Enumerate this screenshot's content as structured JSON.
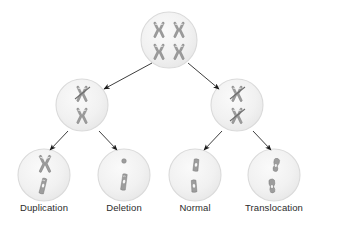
{
  "diagram": {
    "type": "flow-tree",
    "colors": {
      "background": "#ffffff",
      "cell_fill": "#f2f2f2",
      "cell_stroke": "#d8d8d8",
      "chromosome_fill": "#9a9a9a",
      "chromosome_stroke": "#6f6f6f",
      "chromosome_band": "#ffffff",
      "arrow": "#1b1b1b",
      "label_text": "#2b2b2b"
    },
    "levels": [
      {
        "name": "parent",
        "cells": [
          {
            "id": "parent-cell",
            "cx": 169,
            "cy": 40,
            "r": 28,
            "label": "",
            "chromosome_count": 4,
            "chromosome_kind": "metacentric-x",
            "description": "Normal cell with two pairs of X-shaped chromosomes"
          }
        ]
      },
      {
        "name": "intermediate",
        "cells": [
          {
            "id": "left-intermediate-cell",
            "cx": 82,
            "cy": 105,
            "r": 26,
            "label": "",
            "chromosome_count": 2,
            "chromosome_kind": "metacentric-x-with-break",
            "description": "Two chromosomes, upper one showing a diagonal break"
          },
          {
            "id": "right-intermediate-cell",
            "cx": 237,
            "cy": 105,
            "r": 26,
            "label": "",
            "chromosome_count": 2,
            "chromosome_kind": "metacentric-x-with-break",
            "description": "Two chromosomes, both showing diagonal breaks"
          }
        ]
      },
      {
        "name": "outcomes",
        "cells": [
          {
            "id": "duplication-cell",
            "cx": 44,
            "cy": 175,
            "r": 26,
            "label": "Duplication",
            "chromosome_count": 2,
            "chromosome_kind": "duplicated-and-normal",
            "description": "Enlarged duplicated chromosome above a shorter chromatid"
          },
          {
            "id": "deletion-cell",
            "cx": 124,
            "cy": 175,
            "r": 26,
            "label": "Deletion",
            "chromosome_count": 2,
            "chromosome_kind": "fragment-and-shortened",
            "description": "Tiny detached fragment above a shortened chromatid"
          },
          {
            "id": "normal-cell",
            "cx": 195,
            "cy": 175,
            "r": 26,
            "label": "Normal",
            "chromosome_count": 2,
            "chromosome_kind": "normal-pair",
            "description": "Two equal-length normal chromatids"
          },
          {
            "id": "translocation-cell",
            "cx": 274,
            "cy": 175,
            "r": 26,
            "label": "Translocation",
            "chromosome_count": 2,
            "chromosome_kind": "translocated-pair",
            "description": "Two chromatids with exchanged bent segments"
          }
        ]
      }
    ],
    "arrows": [
      {
        "id": "arrow-parent-to-left",
        "from": "parent-cell",
        "to": "left-intermediate-cell",
        "x1": 152,
        "y1": 63,
        "x2": 104,
        "y2": 89
      },
      {
        "id": "arrow-parent-to-right",
        "from": "parent-cell",
        "to": "right-intermediate-cell",
        "x1": 188,
        "y1": 63,
        "x2": 219,
        "y2": 89
      },
      {
        "id": "arrow-left-to-duplication",
        "from": "left-intermediate-cell",
        "to": "duplication-cell",
        "x1": 68,
        "y1": 131,
        "x2": 50,
        "y2": 150
      },
      {
        "id": "arrow-left-to-deletion",
        "from": "left-intermediate-cell",
        "to": "deletion-cell",
        "x1": 99,
        "y1": 131,
        "x2": 117,
        "y2": 150
      },
      {
        "id": "arrow-right-to-normal",
        "from": "right-intermediate-cell",
        "to": "normal-cell",
        "x1": 222,
        "y1": 131,
        "x2": 204,
        "y2": 150
      },
      {
        "id": "arrow-right-to-translocation",
        "from": "right-intermediate-cell",
        "to": "translocation-cell",
        "x1": 253,
        "y1": 131,
        "x2": 271,
        "y2": 150
      }
    ],
    "labels": [
      {
        "id": "label-duplication",
        "text": "Duplication",
        "x": 44,
        "y": 207
      },
      {
        "id": "label-deletion",
        "text": "Deletion",
        "x": 124,
        "y": 207
      },
      {
        "id": "label-normal",
        "text": "Normal",
        "x": 195,
        "y": 207
      },
      {
        "id": "label-translocation",
        "text": "Translocation",
        "x": 274,
        "y": 207
      }
    ]
  }
}
